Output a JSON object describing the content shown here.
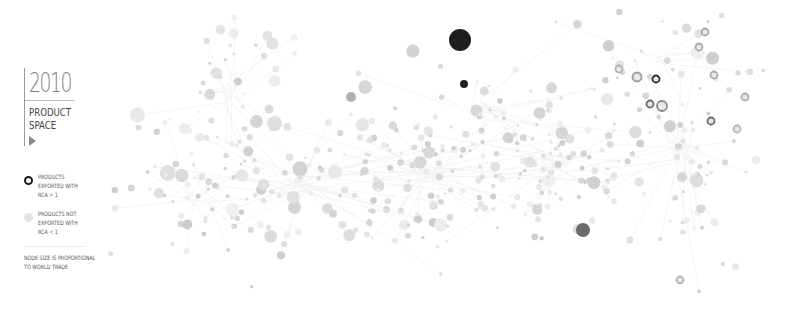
{
  "sidebar": {
    "year": "2010",
    "title_line1": "PRODUCT",
    "title_line2": "SPACE",
    "play_icon": "play-triangle-icon"
  },
  "legend": {
    "items": [
      {
        "label": "PRODUCTS\nEXPORTED WITH\nRCA > 1",
        "icon": "ring-node-icon",
        "color": "#1a1a1a"
      },
      {
        "label": "PRODUCTS NOT\nEXPORTED WITH\nRCA < 1",
        "icon": "filled-node-icon",
        "color": "#e3e3e3"
      }
    ],
    "note": "NODE SIZE IS PROPORTIONAL\nTO WORLD TRADE"
  },
  "colors": {
    "background": "#ffffff",
    "node_default": "#dcdcdc",
    "edge": "#efefef",
    "rca_dark": "#1e1e1e"
  },
  "highlighted_nodes": [
    {
      "x": 460,
      "y": 40,
      "r": 11,
      "fill": "#1e1e1e",
      "ring": false
    },
    {
      "x": 464,
      "y": 84,
      "r": 4,
      "fill": "#1e1e1e",
      "ring": false
    },
    {
      "x": 351,
      "y": 97,
      "r": 5,
      "fill": "#b0b0b0",
      "ring": false
    },
    {
      "x": 583,
      "y": 230,
      "r": 7,
      "fill": "#6a6a6a",
      "ring": false
    },
    {
      "x": 637,
      "y": 77,
      "r": 4.5,
      "fill": "#9a9a9a",
      "ring": true
    },
    {
      "x": 656,
      "y": 79,
      "r": 3.5,
      "fill": "#2a2a2a",
      "ring": true
    },
    {
      "x": 650,
      "y": 104,
      "r": 3.5,
      "fill": "#6a6a6a",
      "ring": true
    },
    {
      "x": 662,
      "y": 106,
      "r": 5,
      "fill": "#8a8a8a",
      "ring": true
    },
    {
      "x": 619,
      "y": 69,
      "r": 3.5,
      "fill": "#b0b0b0",
      "ring": true
    },
    {
      "x": 711,
      "y": 121,
      "r": 3.5,
      "fill": "#6a6a6a",
      "ring": true
    },
    {
      "x": 705,
      "y": 32,
      "r": 3.5,
      "fill": "#aaaaaa",
      "ring": true
    },
    {
      "x": 699,
      "y": 47,
      "r": 3.5,
      "fill": "#aaaaaa",
      "ring": true
    },
    {
      "x": 714,
      "y": 75,
      "r": 3.5,
      "fill": "#aaaaaa",
      "ring": true
    },
    {
      "x": 745,
      "y": 97,
      "r": 3.5,
      "fill": "#aaaaaa",
      "ring": true
    },
    {
      "x": 737,
      "y": 129,
      "r": 3.5,
      "fill": "#b5b5b5",
      "ring": true
    },
    {
      "x": 680,
      "y": 280,
      "r": 3.5,
      "fill": "#b5b5b5",
      "ring": true
    }
  ]
}
